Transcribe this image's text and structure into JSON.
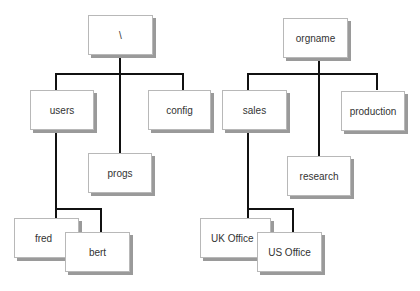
{
  "trees": [
    {
      "name": "filesystem",
      "root": {
        "label": "\\"
      },
      "children": [
        {
          "label": "users",
          "children": [
            {
              "label": "fred"
            },
            {
              "label": "bert"
            }
          ]
        },
        {
          "label": "progs"
        },
        {
          "label": "config"
        }
      ]
    },
    {
      "name": "organisation",
      "root": {
        "label": "orgname"
      },
      "children": [
        {
          "label": "sales",
          "children": [
            {
              "label": "UK Office"
            },
            {
              "label": "US Office"
            }
          ]
        },
        {
          "label": "research"
        },
        {
          "label": "production"
        }
      ]
    }
  ],
  "colors": {
    "line": "#111111",
    "box_border": "#b8b8b8",
    "shadow": "#9a9a9a",
    "text": "#333333"
  }
}
